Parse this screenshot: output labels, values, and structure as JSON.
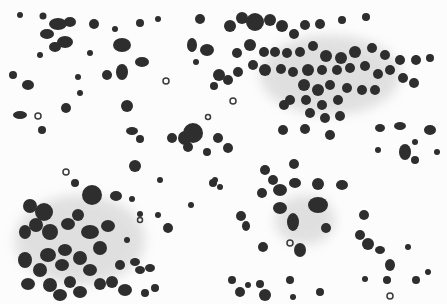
{
  "image": {
    "description": "Grayscale cytology micrograph showing scattered dark round cells and clusters on a white background",
    "width": 447,
    "height": 304,
    "colors": {
      "background": "#fcfcfc",
      "cell": "#2e2e2e",
      "cell_light": "#4a4a4a",
      "cytoplasm": "#d8d8d8"
    }
  }
}
